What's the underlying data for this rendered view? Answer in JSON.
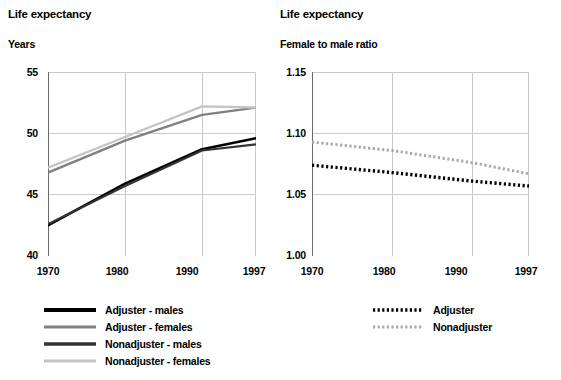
{
  "left": {
    "title": "Life expectancy",
    "subtitle": "Years",
    "legend": [
      {
        "label": "Adjuster - males",
        "color": "#000000",
        "style": "solid"
      },
      {
        "label": "Adjuster - females",
        "color": "#808080",
        "style": "solid"
      },
      {
        "label": "Nonadjuster - males",
        "color": "#333333",
        "style": "solid"
      },
      {
        "label": "Nonadjuster - females",
        "color": "#c4c4c4",
        "style": "solid"
      }
    ],
    "ytick_labels": [
      "55",
      "50",
      "45",
      "40"
    ],
    "xtick_labels": [
      "1970",
      "1980",
      "1990",
      "1997"
    ]
  },
  "right": {
    "title": "Life expectancy",
    "subtitle": "Female to male ratio",
    "legend": [
      {
        "label": "Adjuster",
        "color": "#000000",
        "style": "dotted"
      },
      {
        "label": "Nonadjuster",
        "color": "#a8a8a8",
        "style": "dotted"
      }
    ],
    "ytick_labels": [
      "1.15",
      "1.10",
      "1.05",
      "1.00"
    ],
    "xtick_labels": [
      "1970",
      "1980",
      "1990",
      "1997"
    ]
  },
  "chart_data": [
    {
      "type": "line",
      "title": "Life expectancy",
      "subtitle": "Years",
      "xlabel": "",
      "ylabel": "Years",
      "x": [
        1970,
        1980,
        1990,
        1997
      ],
      "xticks": [
        1970,
        1980,
        1990,
        1997
      ],
      "yticks": [
        40,
        45,
        50,
        55
      ],
      "xlim": [
        1970,
        1997
      ],
      "ylim": [
        40,
        55
      ],
      "grid": true,
      "legend_position": "below",
      "series": [
        {
          "name": "Adjuster - males",
          "values": [
            42.5,
            45.9,
            48.7,
            49.6
          ],
          "color": "#000000",
          "style": "solid"
        },
        {
          "name": "Adjuster - females",
          "values": [
            46.8,
            49.4,
            51.5,
            52.1
          ],
          "color": "#808080",
          "style": "solid"
        },
        {
          "name": "Nonadjuster - males",
          "values": [
            42.6,
            45.7,
            48.6,
            49.1
          ],
          "color": "#333333",
          "style": "solid"
        },
        {
          "name": "Nonadjuster - females",
          "values": [
            47.2,
            49.7,
            52.2,
            52.1
          ],
          "color": "#c4c4c4",
          "style": "solid"
        }
      ]
    },
    {
      "type": "line",
      "title": "Life expectancy",
      "subtitle": "Female to male ratio",
      "xlabel": "",
      "ylabel": "Female to male ratio",
      "x": [
        1970,
        1980,
        1990,
        1997
      ],
      "xticks": [
        1970,
        1980,
        1990,
        1997
      ],
      "yticks": [
        1.0,
        1.05,
        1.1,
        1.15
      ],
      "xlim": [
        1970,
        1997
      ],
      "ylim": [
        1.0,
        1.15
      ],
      "grid": true,
      "legend_position": "below",
      "series": [
        {
          "name": "Adjuster",
          "values": [
            1.074,
            1.068,
            1.061,
            1.057
          ],
          "color": "#000000",
          "style": "dotted"
        },
        {
          "name": "Nonadjuster",
          "values": [
            1.093,
            1.086,
            1.076,
            1.067
          ],
          "color": "#a8a8a8",
          "style": "dotted"
        }
      ]
    }
  ]
}
